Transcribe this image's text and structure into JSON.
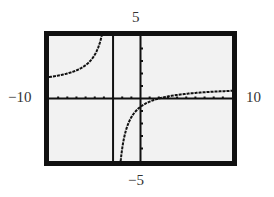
{
  "window": {
    "ymax_label": "5",
    "ymin_label": "−5",
    "xmin_label": "−10",
    "xmax_label": "10"
  },
  "colors": {
    "frame": "#111111",
    "screen_bg": "#f2f2f2",
    "curve": "#111111",
    "axes": "#111111"
  },
  "chart_data": {
    "type": "line",
    "title": "",
    "xlabel": "",
    "ylabel": "",
    "xlim": [
      -10,
      10
    ],
    "ylim": [
      -5,
      5
    ],
    "xscale_ticks": 1,
    "yscale_ticks": 1,
    "grid": false,
    "function_estimate": "y = (x - 2) / (x + 3)",
    "vertical_asymptote": -3,
    "horizontal_asymptote": 1,
    "series": [
      {
        "name": "left branch",
        "x": [
          -10,
          -9,
          -8,
          -7,
          -6,
          -5,
          -4.5,
          -4,
          -3.6
        ],
        "y": [
          1.71,
          1.83,
          2.0,
          2.25,
          2.67,
          3.5,
          4.33,
          6.0,
          9.33
        ]
      },
      {
        "name": "right branch",
        "x": [
          -2.6,
          -2.4,
          -2,
          -1.5,
          -1,
          0,
          1,
          2,
          4,
          6,
          8,
          10
        ],
        "y": [
          -11.5,
          -7.33,
          -4.0,
          -2.33,
          -1.5,
          -0.67,
          -0.25,
          0.0,
          0.29,
          0.44,
          0.55,
          0.62
        ]
      }
    ]
  }
}
